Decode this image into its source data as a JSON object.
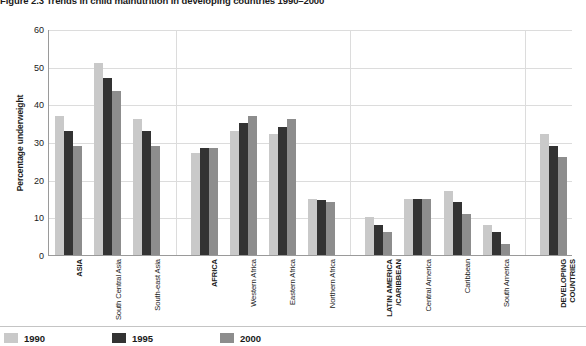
{
  "figure": {
    "title_prefix": "Figure 2.3",
    "title_main": "Trends in child malnutrition in developing countries 1990–2000",
    "title_full": "Figure 2.3 Trends in child malnutrition in developing countries 1990–2000"
  },
  "chart_data": {
    "type": "bar",
    "title": "Figure 2.3 Trends in child malnutrition in developing countries 1990–2000",
    "xlabel": "",
    "ylabel": "Percentage underweight",
    "ylim": [
      0,
      60
    ],
    "yticks": [
      0,
      10,
      20,
      30,
      40,
      50,
      60
    ],
    "grid": true,
    "legend_position": "bottom-left",
    "categories": [
      "ASIA",
      "South Central Asia",
      "South-east Asia",
      "AFRICA",
      "Western Africa",
      "Eastern Africa",
      "Northern Africa",
      "LATIN AMERICA\n/CARIBBEAN",
      "Central America",
      "Caribbean",
      "South America",
      "DEVELOPING\nCOUNTRIES"
    ],
    "category_emphasis": [
      true,
      false,
      false,
      true,
      false,
      false,
      false,
      true,
      false,
      false,
      false,
      true
    ],
    "groups": [
      {
        "name": "Asia",
        "categories": [
          "ASIA",
          "South Central Asia",
          "South-east Asia"
        ]
      },
      {
        "name": "Africa",
        "categories": [
          "AFRICA",
          "Western Africa",
          "Eastern Africa",
          "Northern Africa"
        ]
      },
      {
        "name": "Latin America/Caribbean",
        "categories": [
          "LATIN AMERICA/CARIBBEAN",
          "Central America",
          "Caribbean",
          "South America"
        ]
      },
      {
        "name": "Developing countries",
        "categories": [
          "DEVELOPING COUNTRIES"
        ]
      }
    ],
    "series": [
      {
        "name": "1990",
        "color": "#c9c9c9",
        "values": [
          37,
          51,
          36,
          27,
          33,
          32,
          15,
          10,
          15,
          17,
          8,
          32
        ]
      },
      {
        "name": "1995",
        "color": "#333333",
        "values": [
          33,
          47,
          33,
          28.5,
          35,
          34,
          14.5,
          8,
          15,
          14,
          6,
          29
        ]
      },
      {
        "name": "2000",
        "color": "#8d8d8d",
        "values": [
          29,
          43.5,
          29,
          28.5,
          37,
          36,
          14,
          6,
          15,
          11,
          3,
          26
        ]
      }
    ]
  },
  "legend": {
    "items": [
      {
        "label": "1990",
        "color": "#c9c9c9"
      },
      {
        "label": "1995",
        "color": "#333333"
      },
      {
        "label": "2000",
        "color": "#8d8d8d"
      }
    ]
  }
}
